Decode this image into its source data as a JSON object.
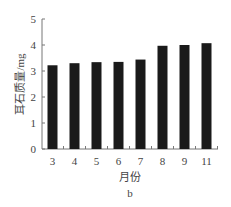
{
  "chart_data": {
    "type": "bar",
    "title": "",
    "caption": "b",
    "xlabel": "月份",
    "ylabel": "耳石质量/mg",
    "categories": [
      "3",
      "4",
      "5",
      "6",
      "7",
      "8",
      "9",
      "11"
    ],
    "values": [
      3.22,
      3.3,
      3.34,
      3.35,
      3.44,
      3.97,
      4.0,
      4.07
    ],
    "ylim": [
      0,
      5
    ],
    "yticks": [
      "0",
      "1",
      "2",
      "3",
      "4",
      "5"
    ],
    "grid": false,
    "bar_color": "#1a1a1a"
  }
}
